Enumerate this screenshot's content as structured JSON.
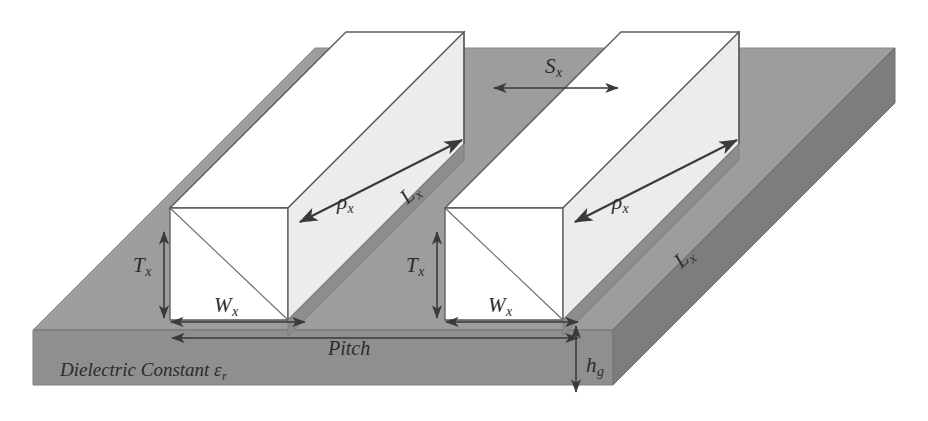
{
  "figure": {
    "type": "3d-isometric-schematic",
    "background_color": "#ffffff"
  },
  "colors": {
    "substrate_top": "#9d9d9d",
    "substrate_front": "#8f8f8f",
    "substrate_side": "#7e7e7e",
    "bar_top": "#ffffff",
    "bar_front": "#ffffff",
    "bar_side": "#e3e3e3",
    "bar_band": "#8b8b8b",
    "outline": "#555555",
    "arrow": "#3a3a3a",
    "text": "#2b2b2b"
  },
  "labels": {
    "spacing": {
      "symbol": "S",
      "subscript": "x"
    },
    "length_left": {
      "symbol": "L",
      "subscript": "x"
    },
    "length_right": {
      "symbol": "L",
      "subscript": "x"
    },
    "resistivity_left": {
      "symbol": "ρ",
      "subscript": "x"
    },
    "resistivity_right": {
      "symbol": "ρ",
      "subscript": "x"
    },
    "thickness_left": {
      "symbol": "T",
      "subscript": "x"
    },
    "thickness_right": {
      "symbol": "T",
      "subscript": "x"
    },
    "width_left": {
      "symbol": "W",
      "subscript": "x"
    },
    "width_right": {
      "symbol": "W",
      "subscript": "x"
    },
    "pitch": {
      "symbol": "Pitch",
      "subscript": ""
    },
    "substrate_height": {
      "symbol": "h",
      "subscript": "g"
    },
    "dielectric": {
      "text": "Dielectric Constant ε",
      "subscript": "r"
    }
  },
  "dimension_arrows": [
    {
      "name": "spacing-arrow",
      "orientation": "horizontal",
      "double_headed": true
    },
    {
      "name": "thickness-left-arrow",
      "orientation": "vertical",
      "double_headed": true
    },
    {
      "name": "thickness-right-arrow",
      "orientation": "vertical",
      "double_headed": true
    },
    {
      "name": "width-left-arrow",
      "orientation": "horizontal",
      "double_headed": true
    },
    {
      "name": "width-right-arrow",
      "orientation": "horizontal",
      "double_headed": true
    },
    {
      "name": "pitch-arrow",
      "orientation": "horizontal",
      "double_headed": true
    },
    {
      "name": "substrate-height-arrow",
      "orientation": "vertical",
      "double_headed": true
    },
    {
      "name": "length-left-arrow",
      "orientation": "diagonal",
      "double_headed": true
    },
    {
      "name": "length-right-arrow",
      "orientation": "diagonal",
      "double_headed": true
    }
  ]
}
